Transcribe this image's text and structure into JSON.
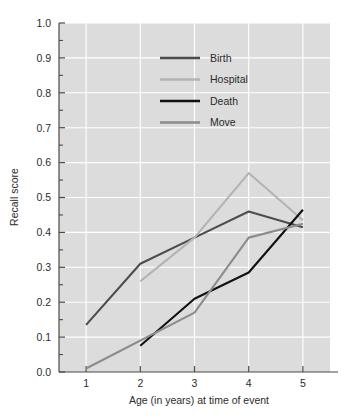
{
  "chart_data": {
    "type": "line",
    "title": "",
    "xlabel": "Age (in years) at time of event",
    "ylabel": "Recall score",
    "x": [
      1,
      2,
      3,
      4,
      5
    ],
    "xtick_labels": [
      "1",
      "2",
      "3",
      "4",
      "5"
    ],
    "ytick_labels": [
      "0.0",
      "0.1",
      "0.2",
      "0.3",
      "0.4",
      "0.5",
      "0.6",
      "0.7",
      "0.8",
      "0.9",
      "1.0"
    ],
    "xlim": [
      0.5,
      5.5
    ],
    "ylim": [
      0.0,
      1.0
    ],
    "grid": true,
    "grid_color": "#ffffff",
    "plot_background": "#dcdcdc",
    "legend_position": "upper-center",
    "minor_tick_step": 0.05,
    "series": [
      {
        "name": "Birth",
        "color": "#4d4d4d",
        "x": [
          1,
          2,
          3,
          4,
          5
        ],
        "values": [
          0.135,
          0.31,
          0.385,
          0.46,
          0.415
        ]
      },
      {
        "name": "Hospital",
        "color": "#b3b3b3",
        "x": [
          2,
          3,
          4,
          5
        ],
        "values": [
          0.26,
          0.385,
          0.57,
          0.435
        ]
      },
      {
        "name": "Death",
        "color": "#111111",
        "x": [
          2,
          3,
          4,
          5
        ],
        "values": [
          0.075,
          0.21,
          0.285,
          0.465
        ]
      },
      {
        "name": "Move",
        "color": "#8c8c8c",
        "x": [
          1,
          3,
          4,
          5
        ],
        "values": [
          0.01,
          0.17,
          0.385,
          0.425
        ]
      }
    ]
  },
  "legend": {
    "items": [
      {
        "label": "Birth"
      },
      {
        "label": "Hospital"
      },
      {
        "label": "Death"
      },
      {
        "label": "Move"
      }
    ]
  },
  "axes": {
    "x_title": "Age (in years) at time of event",
    "y_title": "Recall score"
  }
}
